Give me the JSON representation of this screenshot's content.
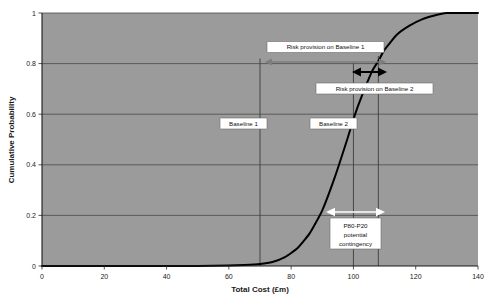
{
  "chart_data": {
    "type": "line",
    "title": "",
    "xlabel": "Total Cost (£m)",
    "ylabel": "Cumulative Probability",
    "xlim": [
      0,
      140
    ],
    "ylim": [
      0,
      1
    ],
    "grid": true,
    "legend_position": "none",
    "x_ticks": [
      "0",
      "20",
      "40",
      "60",
      "80",
      "100",
      "120",
      "140"
    ],
    "x_tick_values": [
      0,
      20,
      40,
      60,
      80,
      100,
      120,
      140
    ],
    "y_ticks": [
      "0",
      "0.2",
      "0.4",
      "0.6",
      "0.8",
      "1"
    ],
    "y_tick_values": [
      0,
      0.2,
      0.4,
      0.6,
      0.8,
      1
    ],
    "series": [
      {
        "name": "Cumulative cost distribution",
        "x": [
          0,
          10,
          20,
          30,
          40,
          50,
          60,
          65,
          70,
          74,
          78,
          82,
          86,
          90,
          94,
          98,
          100,
          102,
          106,
          108,
          110,
          114,
          118,
          122,
          126,
          130,
          134,
          140
        ],
        "values": [
          0.0,
          0.0,
          0.0,
          0.0,
          0.0,
          0.0,
          0.002,
          0.004,
          0.008,
          0.016,
          0.035,
          0.07,
          0.13,
          0.22,
          0.35,
          0.5,
          0.58,
          0.65,
          0.77,
          0.81,
          0.855,
          0.915,
          0.95,
          0.975,
          0.99,
          1.0,
          1.0,
          1.0
        ]
      }
    ],
    "markers": [
      {
        "name": "baseline-1",
        "x": 70,
        "label": "Baseline 1"
      },
      {
        "name": "baseline-2",
        "x": 100,
        "label": "Baseline 2"
      },
      {
        "name": "p80-line",
        "x": 108,
        "label": ""
      }
    ],
    "annotations": [
      {
        "name": "risk-provision-baseline-1",
        "label": "Risk provision on Baseline 1",
        "from_x": 70,
        "to_x": 108,
        "at_y": 0.83
      },
      {
        "name": "risk-provision-baseline-2",
        "label": "Risk provision on Baseline 2",
        "from_x": 100,
        "to_x": 108,
        "at_y": 0.79
      },
      {
        "name": "p80-p20-contingency",
        "label_line1": "P80-P20",
        "label_line2": "potential",
        "label_line3": "contingency",
        "from_x": 93,
        "to_x": 108,
        "at_y": 0.21
      }
    ],
    "colors": {
      "plot_background": "#9b9b9b",
      "page_background": "#ffffff",
      "curve": "#000000",
      "gridline": "#4a4a4a",
      "axis": "#1a1a1a",
      "marker_line": "#3d3d3d",
      "arrow_grey": "#7d7d7d",
      "arrow_black": "#000000",
      "arrow_white": "#ffffff",
      "callout_fill": "#ffffff",
      "callout_border": "#6b6b6b"
    }
  }
}
